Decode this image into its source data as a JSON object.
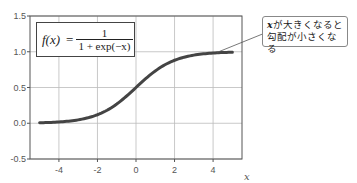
{
  "chart_data": {
    "type": "line",
    "title": "",
    "xlabel": "x",
    "ylabel": "",
    "xlim": [
      -5.5,
      5.5
    ],
    "ylim": [
      -0.5,
      1.5
    ],
    "grid": true,
    "x_ticks": [
      -4,
      -2,
      0,
      2,
      4
    ],
    "x_tick_labels": [
      "-4",
      "-2",
      "0",
      "2",
      "4"
    ],
    "y_ticks": [
      -0.5,
      0.0,
      0.5,
      1.0,
      1.5
    ],
    "y_tick_labels": [
      "-0.5",
      "0.0",
      "0.5",
      "1.0",
      "1.5"
    ],
    "series": [
      {
        "name": "sigmoid",
        "function": "1/(1+exp(-x))",
        "x": [
          -5,
          -4,
          -3,
          -2,
          -1,
          0,
          1,
          2,
          3,
          4,
          5
        ],
        "values": [
          0.007,
          0.018,
          0.047,
          0.119,
          0.269,
          0.5,
          0.731,
          0.881,
          0.953,
          0.982,
          0.993
        ],
        "color": "#444444"
      }
    ],
    "annotations": [
      {
        "type": "formula_box",
        "text": "f(x) = 1 / (1 + exp(-x))"
      },
      {
        "type": "callout",
        "lines": [
          "xが大きくなると",
          "勾配が小さくなる"
        ],
        "points_to": {
          "x": 4.2,
          "y": 0.99
        }
      }
    ]
  },
  "formula": {
    "lhs": "f(x)",
    "eq": "=",
    "num": "1",
    "den": "1 + exp(−x)"
  },
  "callout": {
    "var": "x",
    "line1_rest": "が大きくなると",
    "line2": "勾配が小さくなる"
  }
}
